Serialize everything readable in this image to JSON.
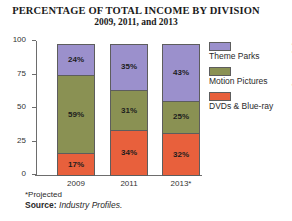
{
  "chart_data": {
    "type": "bar",
    "subtype": "stacked-100-percent",
    "title": "PERCENTAGE OF TOTAL INCOME BY DIVISION",
    "subtitle": "2009, 2011, and 2013",
    "xlabel": "",
    "ylabel": "",
    "categories": [
      "2009",
      "2011",
      "2013*"
    ],
    "ylim": [
      0,
      100
    ],
    "yticks": [
      "0",
      "25",
      "50",
      "75",
      "100"
    ],
    "grid": false,
    "legend_position": "right",
    "series": [
      {
        "name": "DVDs & Blue-ray",
        "color": "#e8603c",
        "values": [
          17,
          34,
          32
        ],
        "labels": [
          "17%",
          "34%",
          "32%"
        ]
      },
      {
        "name": "Motion Pictures",
        "color": "#8a9153",
        "values": [
          59,
          31,
          25
        ],
        "labels": [
          "59%",
          "31%",
          "25%"
        ]
      },
      {
        "name": "Theme Parks",
        "color": "#9b90cc",
        "values": [
          24,
          35,
          43
        ],
        "labels": [
          "24%",
          "35%",
          "43%"
        ]
      }
    ],
    "annotations": {
      "footnote": "*Projected",
      "source_label": "Source:",
      "source_name": "Industry Profiles.",
      "copyright": "© Cengage Learning 2013"
    }
  }
}
